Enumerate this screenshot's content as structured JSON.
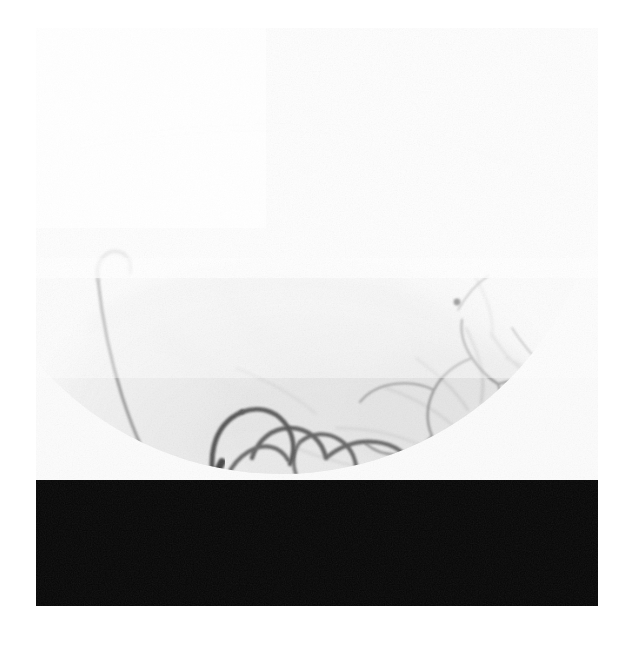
{
  "image": {
    "modality": "DSA",
    "study_type": "Digital Subtraction Angiography",
    "region": "Posterior fossa / cerebral angiogram",
    "view": "Axial-oblique",
    "frame": {
      "x": 36,
      "y": 28,
      "width": 562,
      "height": 578
    },
    "canvas": {
      "width": 623,
      "height": 647
    },
    "colors": {
      "page_background": "#ffffff",
      "film_background": "#fcfcfc",
      "soft_tissue_light": "#f5f5f5",
      "soft_tissue_mid": "#ededed",
      "collimator_black": "#070707",
      "vessel_dark": "#1b1b1b",
      "vessel_mid": "#6a6a6a",
      "vessel_faint": "#9f9f9f",
      "vessel_very_faint": "#c2c2c2"
    },
    "fov": {
      "shape": "circle",
      "center_x": 281,
      "center_y": 152,
      "radius": 322,
      "description": "circular image intensifier field of view with black collimated corners at lower left and lower right"
    },
    "vessels": {
      "main_trunk": {
        "name": "large-opacified-artery",
        "density": "dark",
        "description": "thick densely opacified vessel entering from the inferior border, ascending and branching superiorly"
      },
      "ascending_branch": {
        "name": "long-thin-ascending-branch",
        "density": "faint",
        "description": "slender vessel curving up and to the left, terminating near mid-upper-left field"
      },
      "network": {
        "name": "distal-branch-network",
        "density": "mid",
        "description": "tortuous looping distal branches spreading to the right across the lower half"
      }
    }
  }
}
